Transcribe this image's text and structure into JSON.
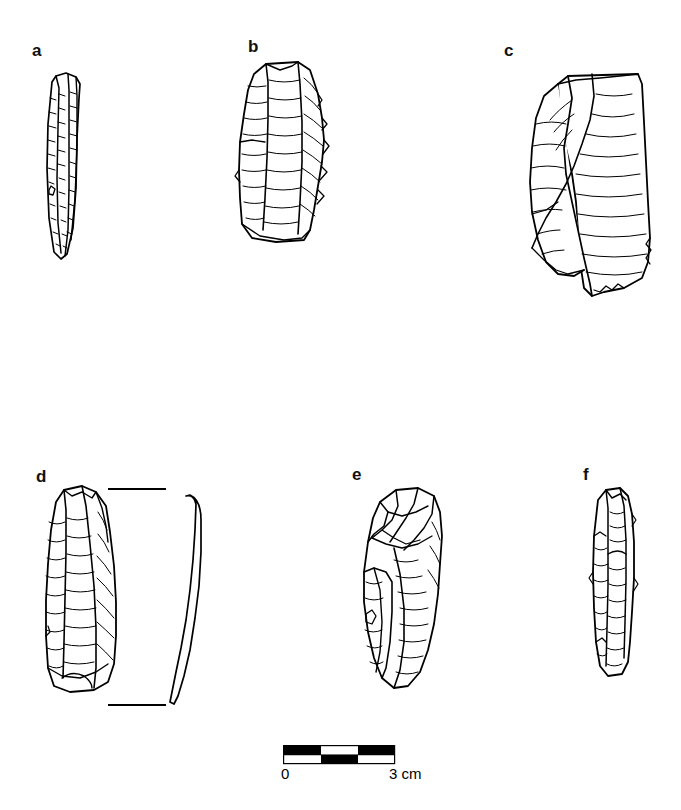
{
  "figure": {
    "type": "lithic-artifact-plate",
    "background_color": "#ffffff",
    "ink_color": "#000000",
    "caption_text": "",
    "panels": [
      {
        "id": "a",
        "label": "a",
        "label_x": 32,
        "label_y": 42,
        "name": "bladelet-core-a",
        "description": "narrow elongated bladelet core, dorsal view",
        "x": 36,
        "y": 68,
        "width": 50,
        "height": 190
      },
      {
        "id": "b",
        "label": "b",
        "label_x": 248,
        "label_y": 38,
        "name": "prismatic-core-b",
        "description": "broad flat core with retouched right margin",
        "x": 232,
        "y": 58,
        "width": 96,
        "height": 192
      },
      {
        "id": "c",
        "label": "c",
        "label_x": 504,
        "label_y": 42,
        "name": "bidirectional-core-c",
        "description": "large core with two converging flake scar faces",
        "x": 506,
        "y": 62,
        "width": 148,
        "height": 254
      },
      {
        "id": "d",
        "label": "d",
        "label_x": 36,
        "label_y": 468,
        "name": "blade-core-d",
        "description": "columnar blade core, dorsal view with profile",
        "x": 36,
        "y": 482,
        "width": 104,
        "height": 218
      },
      {
        "id": "e",
        "label": "e",
        "label_x": 352,
        "label_y": 466,
        "name": "discoidal-core-e",
        "description": "oval core with radial flake scars",
        "x": 352,
        "y": 482,
        "width": 98,
        "height": 212
      },
      {
        "id": "f",
        "label": "f",
        "label_x": 583,
        "label_y": 466,
        "name": "bladelet-core-f",
        "description": "small narrow core, dorsal view",
        "x": 580,
        "y": 482,
        "width": 62,
        "height": 200
      }
    ],
    "profile": {
      "name": "profile-view-d",
      "description": "lateral profile section of artifact d",
      "x": 168,
      "y": 490,
      "width": 34,
      "height": 215
    },
    "measurement_ticks": [
      {
        "name": "tick-upper-d",
        "x": 108,
        "y": 488,
        "width": 58
      },
      {
        "name": "tick-lower-d",
        "x": 108,
        "y": 704,
        "width": 58
      }
    ],
    "scale": {
      "name": "scale-bar",
      "x": 283,
      "y": 745,
      "width": 111,
      "height": 18,
      "rows": 2,
      "segments": 3,
      "unit_length_px": 37,
      "top_pattern": [
        "#000000",
        "#ffffff",
        "#000000"
      ],
      "bottom_pattern": [
        "#ffffff",
        "#000000",
        "#ffffff"
      ],
      "start_label": "0",
      "end_label": "3 cm",
      "start_label_x": 281,
      "end_label_x": 389,
      "label_y": 766
    }
  }
}
